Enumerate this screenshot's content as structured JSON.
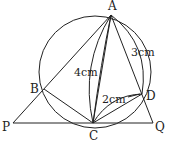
{
  "diagram": {
    "type": "geometry",
    "circle": {
      "cx": 95,
      "cy": 72,
      "r": 56
    },
    "points": {
      "A": {
        "label": "A",
        "x": 111,
        "y": 15
      },
      "B": {
        "label": "B",
        "x": 44,
        "y": 89
      },
      "C": {
        "label": "C",
        "x": 93,
        "y": 123
      },
      "D": {
        "label": "D",
        "x": 142,
        "y": 94
      },
      "P": {
        "label": "P",
        "x": 13,
        "y": 123
      },
      "Q": {
        "label": "Q",
        "x": 153,
        "y": 123
      }
    },
    "measurements": {
      "AC": "4cm",
      "AD": "3cm",
      "CD": "2cm"
    },
    "stroke_color": "#222222"
  }
}
